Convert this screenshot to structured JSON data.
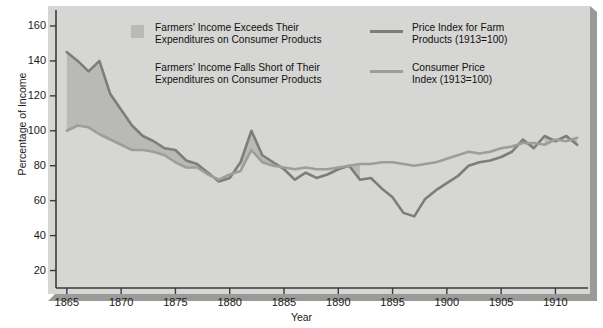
{
  "chart_data": {
    "type": "line",
    "title": "",
    "xlabel": "Year",
    "ylabel": "Percentage of Income",
    "xlim": [
      1864,
      1913
    ],
    "ylim": [
      10,
      168
    ],
    "grid": false,
    "legend_position": "top",
    "xticks": [
      "1865",
      "1870",
      "1875",
      "1880",
      "1885",
      "1890",
      "1895",
      "1900",
      "1905",
      "1910"
    ],
    "xtick_values": [
      1865,
      1870,
      1875,
      1880,
      1885,
      1890,
      1895,
      1900,
      1905,
      1910
    ],
    "yticks": [
      "20",
      "40",
      "60",
      "80",
      "100",
      "120",
      "140",
      "160"
    ],
    "ytick_values": [
      20,
      40,
      60,
      80,
      100,
      120,
      140,
      160
    ],
    "x": [
      1865,
      1866,
      1867,
      1868,
      1869,
      1870,
      1871,
      1872,
      1873,
      1874,
      1875,
      1876,
      1877,
      1878,
      1879,
      1880,
      1881,
      1882,
      1883,
      1884,
      1885,
      1886,
      1887,
      1888,
      1889,
      1890,
      1891,
      1892,
      1893,
      1894,
      1895,
      1896,
      1897,
      1898,
      1899,
      1900,
      1901,
      1902,
      1903,
      1904,
      1905,
      1906,
      1907,
      1908,
      1909,
      1910,
      1911,
      1912
    ],
    "series": [
      {
        "name": "Price Index for Farm Products (1913=100)",
        "color": "#7d7d7b",
        "values": [
          145,
          140,
          134,
          140,
          121,
          112,
          103,
          97,
          94,
          90,
          89,
          83,
          81,
          76,
          71,
          73,
          82,
          100,
          86,
          82,
          78,
          72,
          76,
          73,
          75,
          78,
          80,
          72,
          73,
          67,
          62,
          53,
          51,
          61,
          66,
          70,
          74,
          80,
          82,
          83,
          85,
          88,
          95,
          90,
          97,
          94,
          97,
          92
        ]
      },
      {
        "name": "Consumer Price Index (1913=100)",
        "color": "#9d9d9b",
        "values": [
          100,
          103,
          102,
          98,
          95,
          92,
          89,
          89,
          88,
          86,
          82,
          79,
          79,
          75,
          72,
          75,
          77,
          89,
          82,
          80,
          79,
          78,
          79,
          78,
          78,
          79,
          80,
          81,
          81,
          82,
          82,
          81,
          80,
          81,
          82,
          84,
          86,
          88,
          87,
          88,
          90,
          91,
          93,
          93,
          92,
          95,
          94,
          96
        ]
      }
    ],
    "shaded_regions": [
      {
        "label": "Farmers' Income Exceeds Their Expenditures on Consumer Products",
        "color": "#b9b9b7",
        "spans": [
          [
            1865,
            1878
          ],
          [
            1881,
            1884
          ],
          [
            1909,
            1910
          ]
        ]
      },
      {
        "label": "Farmers' Income Falls Short of Their Expenditures on Consumer Products",
        "color": "#d6d6d4",
        "spans": [
          [
            1878,
            1881
          ],
          [
            1884,
            1909
          ]
        ]
      }
    ]
  },
  "legend": {
    "items": [
      {
        "marker": "swatch",
        "line1": "Farmers' Income Exceeds Their",
        "line2": "Expenditures on Consumer Products"
      },
      {
        "marker": "none",
        "line1": "Farmers' Income Falls Short of Their",
        "line2": "Expenditures on Consumer Products"
      },
      {
        "marker": "line-dark",
        "line1": "Price Index for Farm",
        "line2": "Products (1913=100)"
      },
      {
        "marker": "line-light",
        "line1": "Consumer Price",
        "line2": "Index  (1913=100)"
      }
    ]
  },
  "axes": {
    "y_title": "Percentage of Income",
    "x_title": "Year"
  },
  "colors": {
    "panel": "#d6d6d4",
    "panel_shadow": "#8e8e8e",
    "bevel": "#9a9a98",
    "farm_line": "#7d7d7b",
    "cpi_line": "#9d9d9b",
    "fill_exceed": "#b9b9b7",
    "axis": "#3a3a3a",
    "text": "#1a1a1a"
  }
}
